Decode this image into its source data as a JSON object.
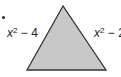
{
  "figure": {
    "shape": "triangle",
    "fill_color": "#c8c8c8",
    "stroke_color": "#333333",
    "vertices": [
      [
        63,
        6
      ],
      [
        27,
        70
      ],
      [
        106,
        70
      ]
    ],
    "labels": {
      "left_side": {
        "base": "x",
        "exp": "2",
        "rest": " − 4"
      },
      "right_side": {
        "base": "x",
        "exp": "2",
        "rest": " − 2"
      }
    }
  }
}
